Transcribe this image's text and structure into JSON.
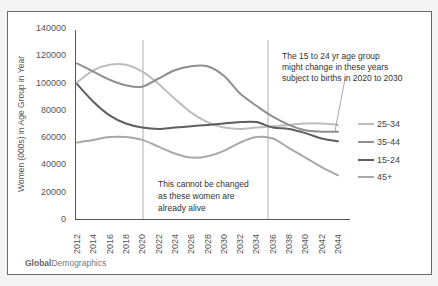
{
  "chart_data": {
    "type": "line",
    "title": "",
    "xlabel": "",
    "ylabel": "Women (000s) in Age Group in Year",
    "ylim": [
      0,
      140000
    ],
    "yticks": [
      0,
      20000,
      40000,
      60000,
      80000,
      100000,
      120000,
      140000
    ],
    "x": [
      2012,
      2014,
      2016,
      2018,
      2020,
      2022,
      2024,
      2026,
      2028,
      2030,
      2032,
      2034,
      2036,
      2038,
      2040,
      2042,
      2044
    ],
    "series": [
      {
        "name": "25-34",
        "color": "#bdbdbd",
        "values": [
          100000,
          109000,
          113000,
          113000,
          108000,
          99000,
          88000,
          78000,
          71000,
          67000,
          66000,
          67000,
          68000,
          69000,
          70000,
          70000,
          69000
        ]
      },
      {
        "name": "35-44",
        "color": "#8f8f8f",
        "values": [
          114000,
          108000,
          102000,
          98000,
          97000,
          103000,
          109000,
          112000,
          112000,
          105000,
          92000,
          83000,
          75000,
          69000,
          65000,
          64000,
          64000
        ]
      },
      {
        "name": "15-24",
        "color": "#5e5e5e",
        "values": [
          99000,
          86000,
          76000,
          70000,
          67000,
          66000,
          67000,
          68000,
          69000,
          70000,
          71000,
          71000,
          67000,
          66000,
          63000,
          59000,
          57000
        ]
      },
      {
        "name": "45+",
        "color": "#a8a8a8",
        "values": [
          56000,
          58000,
          60000,
          60000,
          58000,
          53000,
          48000,
          45000,
          46000,
          50000,
          56000,
          60000,
          59000,
          52000,
          45000,
          38000,
          32000
        ]
      }
    ],
    "vertical_markers": [
      2020,
      2036
    ],
    "annotations": [
      {
        "text": "This cannot be changed as these women are already alive",
        "region": "2020-2036"
      },
      {
        "text": "The 15 to 24 yr age group might change in these years subject to births in 2020 to 2030",
        "region": "2036-2044"
      }
    ],
    "grid": false,
    "legend_position": "right"
  },
  "annotation_left": {
    "line1": "This cannot be changed",
    "line2": "as these women are",
    "line3": "already alive"
  },
  "annotation_right": {
    "line1": "The 15 to 24 yr age group",
    "line2": "might change in these years",
    "line3": "subject to  births in 2020 to 2030"
  },
  "legend": [
    {
      "label": "25-34"
    },
    {
      "label": "35-44"
    },
    {
      "label": "15-24"
    },
    {
      "label": "45+"
    }
  ],
  "brand": {
    "bold": "Global",
    "regular": "Demographics"
  }
}
